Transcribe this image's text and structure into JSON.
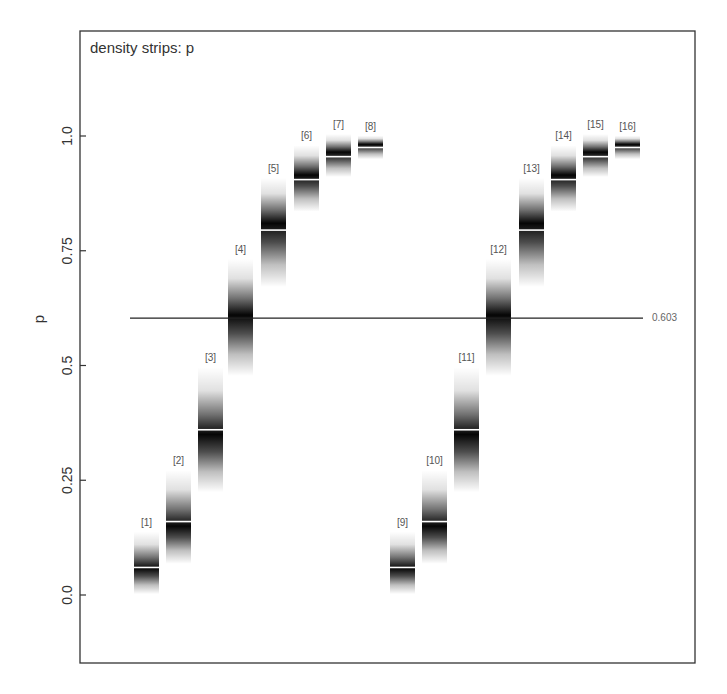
{
  "chart_data": {
    "type": "density-strips",
    "title": "density strips: p",
    "xlabel": "",
    "ylabel": "p",
    "ylim": [
      -0.15,
      1.18
    ],
    "yticks": [
      {
        "value": 0.0,
        "label": "0.0"
      },
      {
        "value": 0.25,
        "label": "0.25"
      },
      {
        "value": 0.5,
        "label": "0.5"
      },
      {
        "value": 0.75,
        "label": "0.75"
      },
      {
        "value": 1.0,
        "label": "1.0"
      }
    ],
    "grid": false,
    "reference_line": {
      "value": 0.603,
      "label": "0.603"
    },
    "series": [
      {
        "label": "[1]",
        "mean": 0.06,
        "lower": 0.03,
        "upper": 0.11,
        "mode": 0.058
      },
      {
        "label": "[2]",
        "mean": 0.16,
        "lower": 0.11,
        "upper": 0.23,
        "mode": 0.15
      },
      {
        "label": "[3]",
        "mean": 0.36,
        "lower": 0.28,
        "upper": 0.44,
        "mode": 0.35
      },
      {
        "label": "[4]",
        "mean": 0.603,
        "lower": 0.53,
        "upper": 0.68,
        "mode": 0.61
      },
      {
        "label": "[5]",
        "mean": 0.795,
        "lower": 0.72,
        "upper": 0.86,
        "mode": 0.81
      },
      {
        "label": "[6]",
        "mean": 0.905,
        "lower": 0.865,
        "upper": 0.95,
        "mode": 0.915
      },
      {
        "label": "[7]",
        "mean": 0.955,
        "lower": 0.93,
        "upper": 0.985,
        "mode": 0.965
      },
      {
        "label": "[8]",
        "mean": 0.975,
        "lower": 0.96,
        "upper": 0.99,
        "mode": 0.982
      },
      {
        "label": "[9]",
        "mean": 0.06,
        "lower": 0.03,
        "upper": 0.11,
        "mode": 0.058
      },
      {
        "label": "[10]",
        "mean": 0.16,
        "lower": 0.11,
        "upper": 0.23,
        "mode": 0.15
      },
      {
        "label": "[11]",
        "mean": 0.36,
        "lower": 0.28,
        "upper": 0.44,
        "mode": 0.35
      },
      {
        "label": "[12]",
        "mean": 0.603,
        "lower": 0.53,
        "upper": 0.68,
        "mode": 0.61
      },
      {
        "label": "[13]",
        "mean": 0.795,
        "lower": 0.72,
        "upper": 0.86,
        "mode": 0.81
      },
      {
        "label": "[14]",
        "mean": 0.905,
        "lower": 0.865,
        "upper": 0.95,
        "mode": 0.915
      },
      {
        "label": "[15]",
        "mean": 0.955,
        "lower": 0.93,
        "upper": 0.985,
        "mode": 0.965
      },
      {
        "label": "[16]",
        "mean": 0.975,
        "lower": 0.96,
        "upper": 0.99,
        "mode": 0.982
      }
    ]
  },
  "layout": {
    "frame": {
      "x0": 80,
      "y0": 31,
      "x1": 695,
      "y1": 663
    },
    "y_at_0": 595,
    "y_at_1": 136,
    "strip_x": [
      134,
      166,
      198,
      228,
      261,
      294,
      326,
      358,
      390,
      422,
      454,
      486,
      519,
      551,
      583,
      615
    ],
    "strip_width": 25,
    "ref_line_x": [
      130,
      643
    ]
  },
  "colors": {
    "frame": "#333333",
    "strip": "#000000",
    "mean_line": "#ffffff",
    "ref_line": "#222222",
    "text": "#333333"
  }
}
